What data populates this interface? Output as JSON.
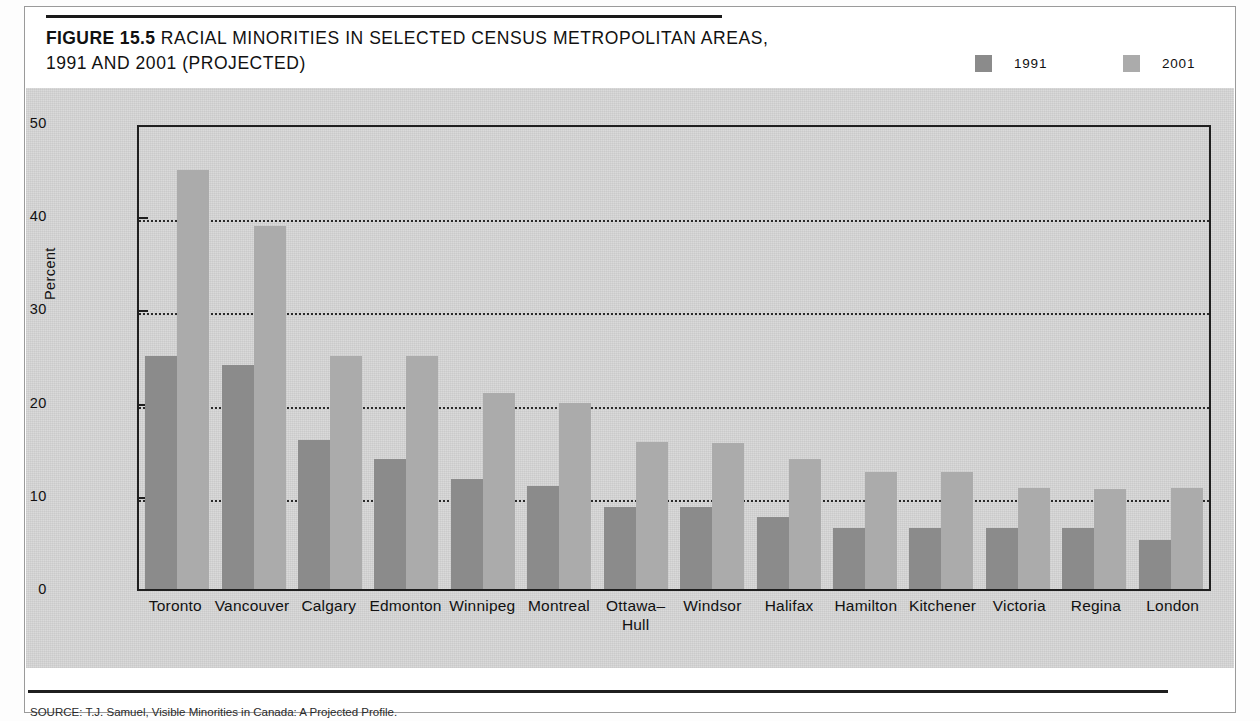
{
  "figure": {
    "label": "FIGURE 15.5",
    "title_line1": "RACIAL MINORITIES IN SELECTED CENSUS METROPOLITAN AREAS,",
    "title_line2": "1991 AND 2001 (PROJECTED)"
  },
  "legend": {
    "items": [
      {
        "label": "1991",
        "color": "#8b8b8b",
        "swatch_name": "legend-swatch-1991"
      },
      {
        "label": "2001",
        "color": "#ababab",
        "swatch_name": "legend-swatch-2001"
      }
    ]
  },
  "source": {
    "text": "SOURCE: T.J. Samuel, Visible Minorities in Canada: A Projected Profile."
  },
  "chart_data": {
    "type": "bar",
    "title": "RACIAL MINORITIES IN SELECTED CENSUS METROPOLITAN AREAS, 1991 AND 2001 (PROJECTED)",
    "xlabel": "",
    "ylabel": "Percent",
    "ylim": [
      0,
      50
    ],
    "yticks": [
      0,
      10,
      20,
      30,
      40,
      50
    ],
    "ytick_labels": [
      "0",
      "10",
      "20",
      "30",
      "40",
      "50"
    ],
    "grid": "horizontal-dotted",
    "gridlines": [
      10,
      20,
      30,
      40
    ],
    "legend_position": "top-right",
    "categories": [
      "Toronto",
      "Vancouver",
      "Calgary",
      "Edmonton",
      "Winnipeg",
      "Montreal",
      "Ottawa–Hull",
      "Windsor",
      "Halifax",
      "Hamilton",
      "Kitchener",
      "Victoria",
      "Regina",
      "London"
    ],
    "category_lines": [
      [
        "Toronto",
        ""
      ],
      [
        "Vancouver",
        ""
      ],
      [
        "Calgary",
        ""
      ],
      [
        "Edmonton",
        ""
      ],
      [
        "Winnipeg",
        ""
      ],
      [
        "Montreal",
        ""
      ],
      [
        "Ottawa–",
        "Hull"
      ],
      [
        "Windsor",
        ""
      ],
      [
        "Halifax",
        ""
      ],
      [
        "Hamilton",
        ""
      ],
      [
        "Kitchener",
        ""
      ],
      [
        "Victoria",
        ""
      ],
      [
        "Regina",
        ""
      ],
      [
        "London",
        ""
      ]
    ],
    "series": [
      {
        "name": "1991",
        "color": "#8b8b8b",
        "values": [
          25.0,
          24.0,
          16.0,
          14.0,
          11.8,
          11.0,
          8.8,
          8.8,
          7.7,
          6.6,
          6.5,
          6.5,
          6.5,
          5.3
        ]
      },
      {
        "name": "2001",
        "color": "#ababab",
        "values": [
          45.0,
          39.0,
          25.0,
          25.0,
          21.0,
          20.0,
          15.8,
          15.7,
          13.9,
          12.6,
          12.6,
          10.8,
          10.7,
          10.8
        ]
      }
    ]
  }
}
